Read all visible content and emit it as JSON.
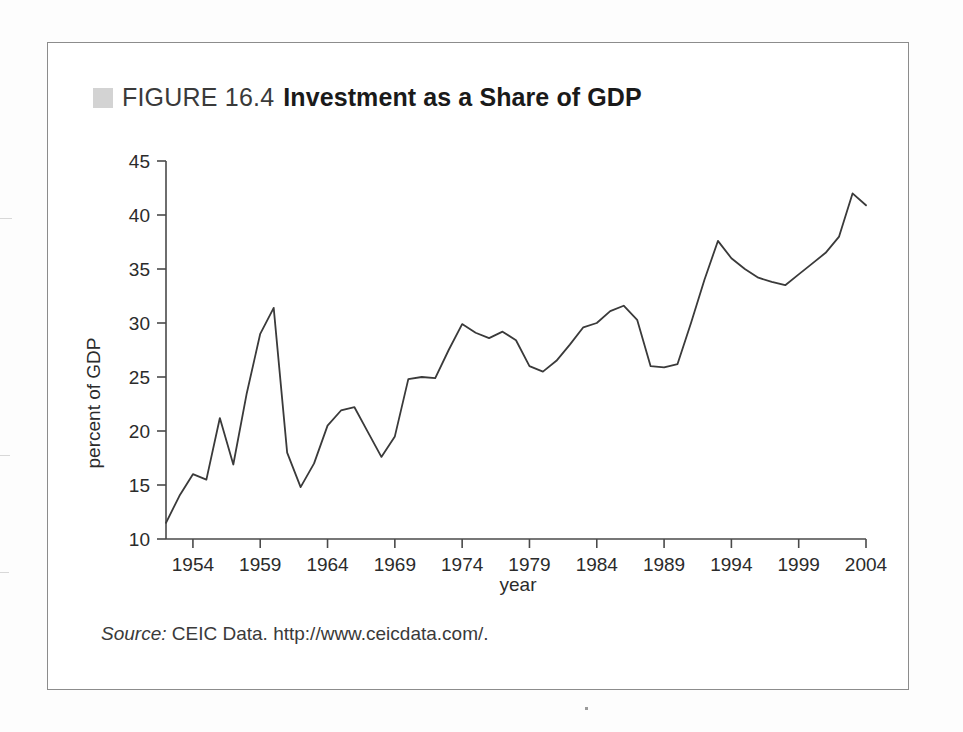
{
  "figure": {
    "swatch_color": "#d3d3d3",
    "number_label": "FIGURE 16.4",
    "title": "Investment as a Share of GDP",
    "source_label": "Source:",
    "source_text": " CEIC Data. http://www.ceicdata.com/."
  },
  "chart_data": {
    "type": "line",
    "title": "Investment as a Share of GDP",
    "xlabel": "year",
    "ylabel": "percent of GDP",
    "xlim": [
      1952,
      2004
    ],
    "ylim": [
      10,
      45
    ],
    "ytick_labels": [
      "10",
      "15",
      "20",
      "25",
      "30",
      "35",
      "40",
      "45"
    ],
    "yticks": [
      10,
      15,
      20,
      25,
      30,
      35,
      40,
      45
    ],
    "xtick_labels": [
      "1954",
      "1959",
      "1964",
      "1969",
      "1974",
      "1979",
      "1984",
      "1989",
      "1994",
      "1999",
      "2004"
    ],
    "xticks": [
      1954,
      1959,
      1964,
      1969,
      1974,
      1979,
      1984,
      1989,
      1994,
      1999,
      2004
    ],
    "grid": false,
    "legend": "none",
    "line_color": "#3a3a3a",
    "series": [
      {
        "name": "Investment share of GDP",
        "x": [
          1952,
          1953,
          1954,
          1955,
          1956,
          1957,
          1958,
          1959,
          1960,
          1961,
          1962,
          1963,
          1964,
          1965,
          1966,
          1967,
          1968,
          1969,
          1970,
          1971,
          1972,
          1973,
          1974,
          1975,
          1976,
          1977,
          1978,
          1979,
          1980,
          1981,
          1982,
          1983,
          1984,
          1985,
          1986,
          1987,
          1988,
          1989,
          1990,
          1991,
          1992,
          1993,
          1994,
          1995,
          1996,
          1997,
          1998,
          1999,
          2000,
          2001,
          2002,
          2003,
          2004
        ],
        "values": [
          11.5,
          14.0,
          16.0,
          15.5,
          21.2,
          16.9,
          23.5,
          29.0,
          31.4,
          18.0,
          14.8,
          17.0,
          20.5,
          21.9,
          22.2,
          19.9,
          17.6,
          19.5,
          24.8,
          25.0,
          24.9,
          27.5,
          29.9,
          29.1,
          28.6,
          29.2,
          28.4,
          26.0,
          25.5,
          26.5,
          28.0,
          29.6,
          30.0,
          31.1,
          31.6,
          30.3,
          26.0,
          25.9,
          26.2,
          30.0,
          34.0,
          37.6,
          36.0,
          35.0,
          34.2,
          33.8,
          33.5,
          34.5,
          35.5,
          36.5,
          38.0,
          42.0,
          40.9
        ]
      }
    ]
  }
}
